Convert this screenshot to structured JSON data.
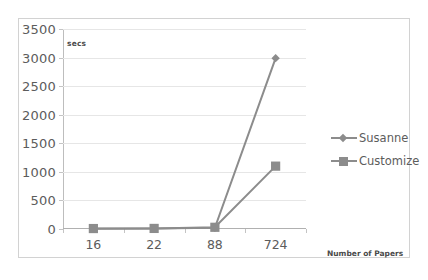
{
  "chart_data": {
    "type": "line",
    "title": "",
    "subtitle": "",
    "xlabel": "Number of Papers",
    "ylabel": "secs",
    "categories": [
      "16",
      "22",
      "88",
      "724"
    ],
    "series": [
      {
        "name": "Susanne",
        "marker": "diamond",
        "color": "#8c8c8c",
        "values": [
          5,
          8,
          20,
          2990
        ]
      },
      {
        "name": "Customize",
        "marker": "square",
        "color": "#8c8c8c",
        "values": [
          8,
          10,
          30,
          1100
        ]
      }
    ],
    "ylim": [
      0,
      3500
    ],
    "ytick_step": 500,
    "yticks": [
      "0",
      "500",
      "1000",
      "1500",
      "2000",
      "2500",
      "3000",
      "3500"
    ],
    "grid": "horizontal",
    "legend_position": "right"
  },
  "legend": {
    "entries": [
      {
        "label": "Susanne"
      },
      {
        "label": "Customize"
      }
    ]
  },
  "colors": {
    "series_gray": "#8c8c8c",
    "gridline": "#e6e6e6",
    "axis": "#bdbdbd",
    "border": "#d2d2d2",
    "text": "#5c5c5c",
    "background": "#ffffff"
  }
}
